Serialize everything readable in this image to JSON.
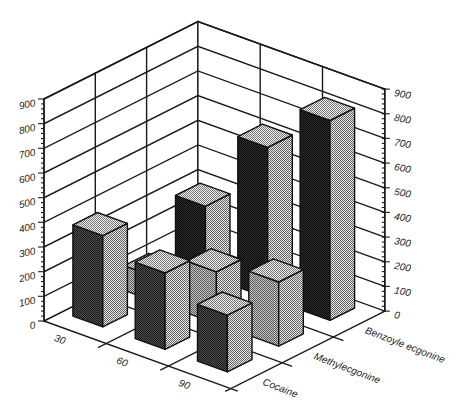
{
  "chart_data": {
    "type": "bar",
    "subtype": "3d-grouped-bar",
    "title": "",
    "xlabel": "",
    "ylabel": "",
    "categories": [
      "30",
      "60",
      "90"
    ],
    "series": [
      {
        "name": "Cocaine",
        "values": [
          370,
          310,
          230
        ],
        "front_colors": [
          "#1c1c1c",
          "#4c4c4c"
        ]
      },
      {
        "name": "Methylecgonine",
        "values": [
          100,
          210,
          260
        ],
        "front_colors": [
          "#5a5a5a",
          "#c4c4c4"
        ]
      },
      {
        "name": "Benzoyle ecgonine",
        "values": [
          280,
          610,
          810
        ],
        "front_colors": [
          "#0c0c0c",
          "#2c2c2c"
        ]
      }
    ],
    "ylim": [
      0,
      900
    ],
    "yticks": [
      0,
      100,
      200,
      300,
      400,
      500,
      600,
      700,
      800,
      900
    ],
    "y_axis_positions": [
      "left",
      "right"
    ],
    "grid": true,
    "legend": null,
    "side_colors": [
      "#646464",
      "#e6e6e6"
    ],
    "top_colors": [
      "#767676",
      "#f0f0f0"
    ],
    "axis_color": "#1a1a1a"
  }
}
